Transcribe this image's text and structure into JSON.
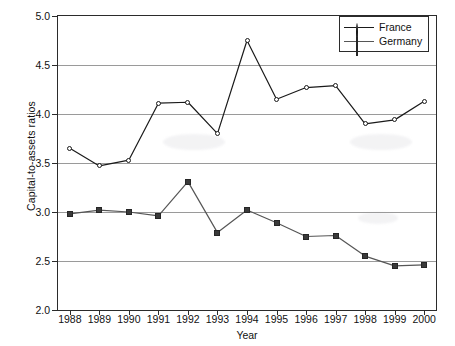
{
  "chart_data": {
    "type": "line",
    "title": "",
    "xlabel": "Year",
    "ylabel": "Capital-to-assets ratios",
    "categories": [
      "1988",
      "1989",
      "1990",
      "1991",
      "1992",
      "1993",
      "1994",
      "1995",
      "1996",
      "1997",
      "1998",
      "1999",
      "2000"
    ],
    "x": [
      1988,
      1989,
      1990,
      1991,
      1992,
      1993,
      1994,
      1995,
      1996,
      1997,
      1998,
      1999,
      2000
    ],
    "xlim": [
      1987.6,
      2000.4
    ],
    "ylim": [
      2.0,
      5.0
    ],
    "yticks": [
      "5.0",
      "4.5",
      "4.0",
      "3.5",
      "3.0",
      "2.5",
      "2.0"
    ],
    "ytick_values": [
      5.0,
      4.5,
      4.0,
      3.5,
      3.0,
      2.5,
      2.0
    ],
    "grid": "horizontal",
    "legend_position": "top-right",
    "series": [
      {
        "name": "France",
        "marker": "open-circle",
        "color": "#1a1a1a",
        "values": [
          3.65,
          3.47,
          3.53,
          4.11,
          4.12,
          3.8,
          4.75,
          4.15,
          4.27,
          4.29,
          3.9,
          3.94,
          4.13
        ]
      },
      {
        "name": "Germany",
        "marker": "filled-square",
        "color": "#565656",
        "values": [
          2.98,
          3.02,
          3.0,
          2.96,
          3.31,
          2.79,
          3.02,
          2.89,
          2.75,
          2.76,
          2.55,
          2.45,
          2.46
        ]
      }
    ]
  },
  "axes": {
    "ylabel": "Capital-to-assets ratios",
    "xlabel": "Year"
  },
  "legend": {
    "entries": [
      {
        "label": "France"
      },
      {
        "label": "Germany"
      }
    ]
  }
}
